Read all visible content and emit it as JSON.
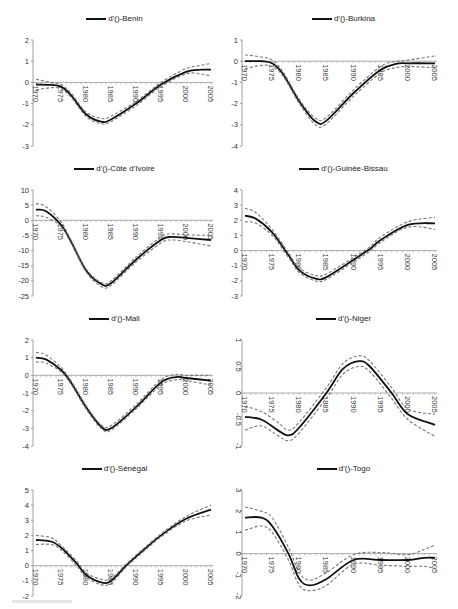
{
  "figure": {
    "legend_prefix": "d'()-",
    "series_style": {
      "estimate": "#111111",
      "bands": "#777777"
    }
  },
  "chart_data": [
    {
      "type": "line",
      "title": "d'()-Benin",
      "xlabel": "",
      "ylabel": "",
      "xticks": [
        1970,
        1975,
        1980,
        1985,
        1990,
        1995,
        2000,
        2005
      ],
      "yticks": [
        2,
        1,
        0,
        -1,
        -2,
        -3
      ],
      "ylim": [
        -3,
        2
      ],
      "xlim": [
        1970,
        2005
      ],
      "grid": false,
      "legend_position": "top",
      "x": [
        1970,
        1973,
        1975,
        1977,
        1980,
        1983,
        1985,
        1990,
        1995,
        2000,
        2003,
        2005
      ],
      "series": [
        {
          "name": "d'()-Benin",
          "values": [
            -0.1,
            -0.12,
            -0.2,
            -0.6,
            -1.5,
            -1.85,
            -1.75,
            -1.0,
            -0.1,
            0.5,
            0.6,
            0.6
          ]
        },
        {
          "name": "upper",
          "values": [
            0.15,
            0.0,
            -0.1,
            -0.5,
            -1.4,
            -1.7,
            -1.6,
            -0.9,
            0.0,
            0.65,
            0.8,
            0.9
          ]
        },
        {
          "name": "lower",
          "values": [
            -0.35,
            -0.25,
            -0.3,
            -0.7,
            -1.6,
            -1.95,
            -1.85,
            -1.1,
            -0.2,
            0.4,
            0.4,
            0.3
          ]
        }
      ]
    },
    {
      "type": "line",
      "title": "d'()-Burkina",
      "xlabel": "",
      "ylabel": "",
      "xticks": [
        1970,
        1975,
        1980,
        1985,
        1990,
        1995,
        2000,
        2005
      ],
      "yticks": [
        1,
        0,
        -1,
        -2,
        -3,
        -4
      ],
      "ylim": [
        -4,
        1
      ],
      "xlim": [
        1970,
        2005
      ],
      "grid": false,
      "legend_position": "top",
      "x": [
        1970,
        1973,
        1975,
        1977,
        1980,
        1983,
        1985,
        1990,
        1995,
        1998,
        2000,
        2005
      ],
      "series": [
        {
          "name": "d'()-Burkina",
          "values": [
            0.0,
            0.0,
            -0.1,
            -0.6,
            -1.9,
            -2.85,
            -2.8,
            -1.5,
            -0.4,
            -0.12,
            -0.1,
            -0.1
          ]
        },
        {
          "name": "upper",
          "values": [
            0.3,
            0.2,
            0.05,
            -0.5,
            -1.8,
            -2.7,
            -2.65,
            -1.35,
            -0.25,
            0.0,
            0.05,
            0.25
          ]
        },
        {
          "name": "lower",
          "values": [
            -0.35,
            -0.2,
            -0.25,
            -0.7,
            -2.0,
            -3.0,
            -2.95,
            -1.65,
            -0.55,
            -0.3,
            -0.25,
            -0.3
          ]
        }
      ]
    },
    {
      "type": "line",
      "title": "d'()-Côte d'Ivoire",
      "xlabel": "",
      "ylabel": "",
      "xticks": [
        1970,
        1975,
        1980,
        1985,
        1990,
        1995,
        2000,
        2005
      ],
      "yticks": [
        10,
        5,
        0,
        -5,
        -10,
        -15,
        -20,
        -25
      ],
      "ylim": [
        -25,
        10
      ],
      "xlim": [
        1970,
        2005
      ],
      "grid": false,
      "legend_position": "top",
      "x": [
        1970,
        1972,
        1975,
        1977,
        1980,
        1983,
        1985,
        1990,
        1995,
        1997,
        2000,
        2005
      ],
      "series": [
        {
          "name": "d'()-Côte d'Ivoire",
          "values": [
            3.5,
            3.0,
            -1.5,
            -7.0,
            -16.5,
            -21.0,
            -20.8,
            -13.0,
            -6.5,
            -5.5,
            -5.8,
            -6.5
          ]
        },
        {
          "name": "upper",
          "values": [
            5.5,
            4.5,
            -0.5,
            -6.5,
            -16.0,
            -20.5,
            -20.0,
            -12.2,
            -5.5,
            -4.5,
            -4.8,
            -5.0
          ]
        },
        {
          "name": "lower",
          "values": [
            1.5,
            1.0,
            -2.0,
            -7.5,
            -17.0,
            -21.8,
            -21.5,
            -13.8,
            -7.5,
            -6.5,
            -7.0,
            -8.5
          ]
        }
      ]
    },
    {
      "type": "line",
      "title": "d'()-Guinée-Bissau",
      "xlabel": "",
      "ylabel": "",
      "xticks": [
        1970,
        1975,
        1980,
        1985,
        1990,
        1995,
        2000,
        2005
      ],
      "yticks": [
        4,
        3,
        2,
        1,
        0,
        -1,
        -2,
        -3
      ],
      "ylim": [
        -3,
        4
      ],
      "xlim": [
        1970,
        2005
      ],
      "grid": false,
      "legend_position": "top",
      "x": [
        1970,
        1972,
        1975,
        1978,
        1980,
        1983,
        1985,
        1990,
        1993,
        1995,
        2000,
        2005
      ],
      "series": [
        {
          "name": "d'()-Guinée-Bissau",
          "values": [
            2.3,
            2.1,
            1.2,
            -0.3,
            -1.3,
            -1.85,
            -1.75,
            -0.6,
            0.1,
            0.7,
            1.7,
            1.8
          ]
        },
        {
          "name": "upper",
          "values": [
            2.8,
            2.5,
            1.4,
            -0.15,
            -1.15,
            -1.65,
            -1.55,
            -0.45,
            0.25,
            0.9,
            1.9,
            2.2
          ]
        },
        {
          "name": "lower",
          "values": [
            1.9,
            1.8,
            1.0,
            -0.45,
            -1.45,
            -2.0,
            -1.9,
            -0.75,
            -0.05,
            0.55,
            1.55,
            1.4
          ]
        }
      ]
    },
    {
      "type": "line",
      "title": "d'()-Mali",
      "xlabel": "",
      "ylabel": "",
      "xticks": [
        1970,
        1975,
        1980,
        1985,
        1990,
        1995,
        2000,
        2005
      ],
      "yticks": [
        2,
        1,
        0,
        -1,
        -2,
        -3,
        -4
      ],
      "ylim": [
        -4,
        2
      ],
      "xlim": [
        1970,
        2005
      ],
      "grid": false,
      "legend_position": "top",
      "x": [
        1970,
        1972,
        1975,
        1977,
        1980,
        1983,
        1985,
        1990,
        1995,
        1998,
        2000,
        2005
      ],
      "series": [
        {
          "name": "d'()-Mali",
          "values": [
            1.0,
            0.9,
            0.3,
            -0.4,
            -1.8,
            -2.9,
            -3.0,
            -1.8,
            -0.4,
            -0.1,
            -0.15,
            -0.3
          ]
        },
        {
          "name": "upper",
          "values": [
            1.3,
            1.15,
            0.45,
            -0.3,
            -1.7,
            -2.8,
            -2.85,
            -1.65,
            -0.25,
            0.05,
            0.0,
            0.0
          ]
        },
        {
          "name": "lower",
          "values": [
            0.75,
            0.7,
            0.2,
            -0.5,
            -1.9,
            -3.0,
            -3.1,
            -1.9,
            -0.55,
            -0.25,
            -0.3,
            -0.55
          ]
        }
      ]
    },
    {
      "type": "line",
      "title": "d'()-Niger",
      "xlabel": "",
      "ylabel": "",
      "xticks": [
        1970,
        1975,
        1980,
        1985,
        1990,
        1995,
        2000,
        2005
      ],
      "yticks": [
        1,
        0.5,
        0,
        -0.5,
        -1
      ],
      "ylim": [
        -1,
        1
      ],
      "xlim": [
        1970,
        2005
      ],
      "grid": false,
      "legend_position": "top",
      "x": [
        1970,
        1973,
        1976,
        1978,
        1980,
        1985,
        1988,
        1991,
        1993,
        1997,
        2000,
        2005
      ],
      "series": [
        {
          "name": "d'()-Niger",
          "values": [
            -0.45,
            -0.5,
            -0.7,
            -0.8,
            -0.65,
            0.0,
            0.45,
            0.6,
            0.5,
            0.0,
            -0.4,
            -0.6
          ]
        },
        {
          "name": "upper",
          "values": [
            -0.25,
            -0.35,
            -0.55,
            -0.7,
            -0.55,
            0.1,
            0.55,
            0.7,
            0.6,
            0.1,
            -0.3,
            -0.4
          ]
        },
        {
          "name": "lower",
          "values": [
            -0.7,
            -0.62,
            -0.8,
            -0.9,
            -0.75,
            -0.1,
            0.35,
            0.5,
            0.4,
            -0.1,
            -0.5,
            -0.82
          ]
        }
      ]
    },
    {
      "type": "line",
      "title": "d'()-Sénégal",
      "xlabel": "",
      "ylabel": "",
      "xticks": [
        1970,
        1975,
        1980,
        1985,
        1990,
        1995,
        2000,
        2005
      ],
      "yticks": [
        5,
        4,
        3,
        2,
        1,
        0,
        -1,
        -2
      ],
      "ylim": [
        -2,
        5
      ],
      "xlim": [
        1970,
        2005
      ],
      "grid": false,
      "legend_position": "top",
      "x": [
        1970,
        1973,
        1975,
        1978,
        1980,
        1983,
        1985,
        1988,
        1990,
        1995,
        2000,
        2005
      ],
      "series": [
        {
          "name": "d'()-Sénégal",
          "values": [
            1.7,
            1.6,
            1.2,
            0.2,
            -0.6,
            -1.1,
            -1.0,
            0.0,
            0.6,
            2.0,
            3.1,
            3.7
          ]
        },
        {
          "name": "upper",
          "values": [
            2.0,
            1.85,
            1.35,
            0.35,
            -0.45,
            -0.9,
            -0.85,
            0.1,
            0.7,
            2.1,
            3.25,
            4.0
          ]
        },
        {
          "name": "lower",
          "values": [
            1.4,
            1.4,
            1.05,
            0.05,
            -0.75,
            -1.25,
            -1.15,
            -0.1,
            0.5,
            1.9,
            2.95,
            3.35
          ]
        }
      ]
    },
    {
      "type": "line",
      "title": "d'()-Togo",
      "xlabel": "",
      "ylabel": "",
      "xticks": [
        1970,
        1975,
        1980,
        1985,
        1990,
        1995,
        2000,
        2005
      ],
      "yticks": [
        3,
        2,
        1,
        0,
        -1,
        -2
      ],
      "ylim": [
        -2,
        3
      ],
      "xlim": [
        1970,
        2005
      ],
      "grid": false,
      "legend_position": "top",
      "x": [
        1970,
        1973,
        1975,
        1978,
        1980,
        1982,
        1985,
        1990,
        1995,
        2000,
        2003,
        2005
      ],
      "series": [
        {
          "name": "d'()-Togo",
          "values": [
            1.7,
            1.7,
            1.3,
            0.0,
            -1.2,
            -1.5,
            -1.2,
            -0.3,
            -0.3,
            -0.3,
            -0.2,
            -0.2
          ]
        },
        {
          "name": "upper",
          "values": [
            2.2,
            2.0,
            1.7,
            0.3,
            -0.9,
            -1.25,
            -0.9,
            -0.05,
            0.05,
            -0.05,
            0.2,
            0.4
          ]
        },
        {
          "name": "lower",
          "values": [
            1.1,
            1.3,
            1.0,
            -0.3,
            -1.5,
            -1.75,
            -1.5,
            -0.5,
            -0.55,
            -0.6,
            -0.6,
            -0.7
          ]
        }
      ]
    }
  ]
}
